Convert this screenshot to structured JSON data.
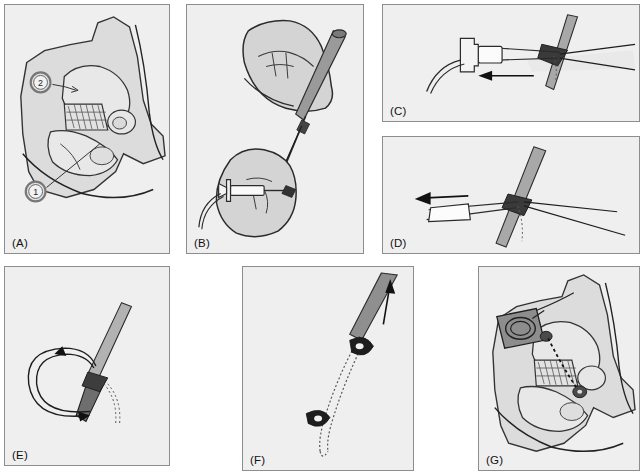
{
  "figure": {
    "type": "multi-panel surgical technique illustration",
    "panel_count": 7,
    "layout": "2 rows; row 1 = A, B, C(top)/D(bottom) stacked; row 2 = E, F, G",
    "style": "line drawing, grayscale shaded",
    "background_color": "#ffffff",
    "panel_fill": "#efefef",
    "panel_border": "#8d8d8d",
    "ink_color": "#1a1a1a",
    "tissue_fill": "#d8d8d8",
    "metal_fill": "#b0b0b0",
    "dark_metal_fill": "#4a4a4a"
  },
  "panels": [
    {
      "id": "a",
      "label": "(A)",
      "caption": "Anatomic overview of pelvis and limb with two marked entry landmarks",
      "callouts": [
        {
          "number": "1",
          "position": "lower-left"
        },
        {
          "number": "2",
          "position": "upper-left"
        }
      ]
    },
    {
      "id": "b",
      "label": "(B)",
      "caption": "Two gloved hands: upper hand guides the trocar, lower hand holds the syringe; suture strand spans between them"
    },
    {
      "id": "c",
      "label": "(C)",
      "caption": "Close-up of cannula hub and tubing; arrow indicates withdrawal direction to the left past the needle",
      "arrow_direction": "left"
    },
    {
      "id": "d",
      "label": "(D)",
      "caption": "Instrument retracted from the needle; arrow indicates continued withdrawal to the left",
      "arrow_direction": "left"
    },
    {
      "id": "e",
      "label": "(E)",
      "caption": "Suture loop rotated around the needle shaft; curved arrows show the direction of loop travel",
      "arrow_direction": "counter-clockwise loop"
    },
    {
      "id": "f",
      "label": "(F)",
      "caption": "Suture loop drawn up along the instrument; straight arrow indicates upward traction",
      "arrow_direction": "up"
    },
    {
      "id": "g",
      "label": "(G)",
      "caption": "Final construct: anchor seated at the proximal site with the dashed suture limb crossing to the distal fixation point"
    }
  ]
}
